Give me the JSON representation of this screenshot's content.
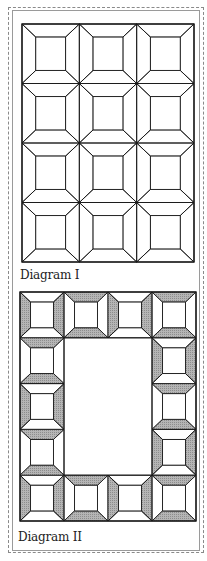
{
  "diagrams": [
    {
      "label": "Diagram I",
      "grid": {
        "rows": 4,
        "cols": 3,
        "x": 22,
        "y": 24,
        "width": 172,
        "height": 238
      },
      "shading": "none"
    },
    {
      "label": "Diagram II",
      "grid": {
        "rows": 5,
        "cols": 4,
        "x": 20,
        "y": 292,
        "width": 176,
        "height": 229
      },
      "layout": "border-ring",
      "blocks": {
        "top": [
          "LR",
          "TB",
          "LR",
          "TB"
        ],
        "bottom": [
          "LR",
          "TB",
          "LR",
          "TB"
        ],
        "left": [
          "LR",
          "TB",
          "LR",
          "TB",
          "LR"
        ],
        "right": [
          "TB",
          "LR",
          "TB",
          "LR",
          "TB"
        ]
      },
      "shade_color": "#b5b5b5"
    }
  ],
  "colors": {
    "line": "#1a1a1a",
    "frame": "#8a8a8a",
    "shade": "#b5b5b5",
    "background": "#ffffff"
  }
}
